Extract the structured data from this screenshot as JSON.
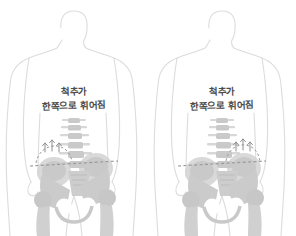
{
  "image": {
    "title": "척추측만증 체형 비교 일러스트",
    "background_color": "#ffffff",
    "width": 296,
    "height": 236,
    "panel_count": 3
  },
  "palette": {
    "body_outline": "#d9d9d9",
    "bone_light": "#e2e2e2",
    "bone_mid": "#cfcfcf",
    "bone_dark": "#b9b9b9",
    "spine": "#c8c8c8",
    "dashed_line": "#9a9a9a",
    "arrow": "#8f8f8f",
    "handwriting": "#4a4a4a"
  },
  "figures": [
    {
      "id": "figure-left",
      "x": 0,
      "annotation": {
        "line1": "척추가",
        "line2": "한쪽으로 휘어짐"
      },
      "markers": {
        "pelvic_line_label": "골반 수평선",
        "arc_label": "장골능 곡선",
        "arrow_count": 3
      }
    },
    {
      "id": "figure-center",
      "x": 148,
      "annotation": {
        "line1": "척추가",
        "line2": "한쪽으로 휘어짐"
      },
      "markers": {
        "pelvic_line_label": "골반 수평선",
        "arc_label": "장골능 곡선",
        "arrow_count": 3
      }
    },
    {
      "id": "figure-right-cropped",
      "x": 296,
      "annotation": {
        "line1": "",
        "line2": ""
      },
      "markers": {
        "pelvic_line_label": "",
        "arc_label": "",
        "arrow_count": 0
      }
    }
  ]
}
